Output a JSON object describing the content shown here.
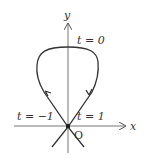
{
  "diagram": {
    "axes": {
      "x_label": "x",
      "y_label": "y",
      "origin_label": "O"
    },
    "annotations": {
      "t0": "t = 0",
      "t_neg1": "t = −1",
      "t1": "t = 1"
    },
    "curve": {
      "description": "parametric loop curve passing through origin twice (t=-1 and t=1), topmost point at t=0",
      "direction_arrows": [
        "up-left branch",
        "down-right branch"
      ]
    },
    "colors": {
      "line": "#333333",
      "axis": "#777777"
    }
  }
}
